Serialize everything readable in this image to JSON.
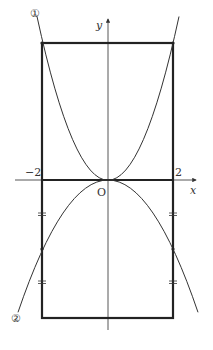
{
  "diagram": {
    "axes": {
      "x_label": "x",
      "y_label": "y",
      "origin_label": "O"
    },
    "tick_labels": {
      "neg_two": "−2",
      "pos_two": "2"
    },
    "curve_labels": {
      "curve1": "①",
      "curve2": "②"
    },
    "colors": {
      "line": "#333333",
      "background": "#ffffff"
    }
  }
}
